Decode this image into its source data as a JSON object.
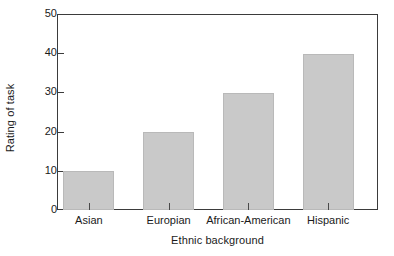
{
  "chart_data": {
    "type": "bar",
    "title": "",
    "subtitle": "",
    "xlabel": "Ethnic background",
    "ylabel": "Rating of task",
    "categories": [
      "Asian",
      "Europian",
      "African-American",
      "Hispanic"
    ],
    "values": [
      10,
      20,
      30,
      40
    ],
    "series": [
      {
        "name": "Rating of task",
        "values": [
          10,
          20,
          30,
          40
        ]
      }
    ],
    "ylim": [
      0,
      50
    ],
    "y_ticks": [
      0,
      10,
      20,
      30,
      40,
      50
    ],
    "y_tick_labels": [
      "0",
      "10",
      "20",
      "30",
      "40",
      "50"
    ],
    "grid": false,
    "legend": null,
    "legend_position": "none",
    "annotations": [],
    "bar_color": "#c9c9c9",
    "bar_border_color": "#b9b9b9",
    "axis_color": "#3b3b3b",
    "background_color": "#ffffff",
    "frame": "full-box",
    "y_tick_direction": "in",
    "x_tick_direction": "in"
  }
}
